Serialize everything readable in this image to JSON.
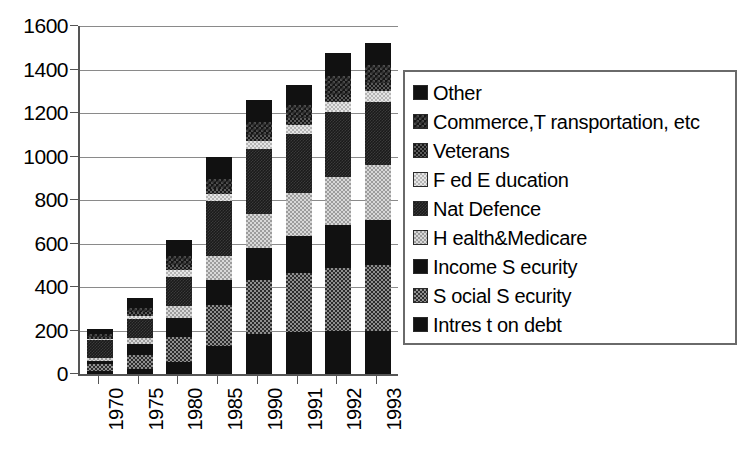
{
  "chart_data": {
    "type": "bar",
    "stacked": true,
    "title": "",
    "xlabel": "",
    "ylabel": "",
    "ylim": [
      0,
      1600
    ],
    "ytick_values": [
      0,
      200,
      400,
      600,
      800,
      1000,
      1200,
      1400,
      1600
    ],
    "ytick_labels": [
      "0",
      "200",
      "400",
      "600",
      "800",
      "1000",
      "1200",
      "1400",
      "1600"
    ],
    "grid": true,
    "legend_position": "right",
    "categories": [
      "1970",
      "1975",
      "1980",
      "1985",
      "1990",
      "1991",
      "1992",
      "1993"
    ],
    "totals": [
      205,
      348,
      615,
      1000,
      1258,
      1330,
      1474,
      1522
    ],
    "series": [
      {
        "name": "Intrest on debt",
        "pattern": "solid-black",
        "color": "#111111",
        "values": [
          14,
          23,
          53,
          130,
          184,
          195,
          199,
          199
        ]
      },
      {
        "name": "Social Security",
        "pattern": "med-gray",
        "color": "#2b2b2b",
        "values": [
          30,
          64,
          118,
          188,
          248,
          269,
          287,
          302
        ]
      },
      {
        "name": "Income Security",
        "pattern": "solid-black",
        "color": "#111111",
        "values": [
          16,
          50,
          87,
          113,
          147,
          172,
          199,
          208
        ]
      },
      {
        "name": "Health&Medicare",
        "pattern": "light-check",
        "color": "#d8d8d8",
        "values": [
          13,
          28,
          55,
          113,
          156,
          195,
          222,
          253
        ]
      },
      {
        "name": "Nat Defence",
        "pattern": "near-black",
        "color": "#1a1a1a",
        "values": [
          82,
          87,
          134,
          253,
          299,
          273,
          298,
          291
        ]
      },
      {
        "name": "Fed Education",
        "pattern": "vlight",
        "color": "#e6e6e6",
        "values": [
          8,
          16,
          32,
          29,
          38,
          43,
          46,
          50
        ]
      },
      {
        "name": "Veterans",
        "pattern": "dark-check",
        "color": "#171717",
        "values": [
          9,
          17,
          21,
          27,
          29,
          32,
          34,
          36
        ]
      },
      {
        "name": "Commerce,Transportation, etc",
        "pattern": "dark-dense",
        "color": "#141414",
        "values": [
          12,
          21,
          43,
          45,
          57,
          59,
          87,
          82
        ]
      },
      {
        "name": "Other",
        "pattern": "solid-black",
        "color": "#111111",
        "values": [
          21,
          42,
          72,
          102,
          100,
          92,
          102,
          101
        ]
      }
    ]
  },
  "legend": {
    "items": [
      {
        "label": "Other",
        "pattern": "solid-black"
      },
      {
        "label": "Commerce,T ransportation, etc",
        "pattern": "dark-dense"
      },
      {
        "label": "Veterans",
        "pattern": "dark-check"
      },
      {
        "label": "F ed E ducation",
        "pattern": "vlight"
      },
      {
        "label": "Nat Defence",
        "pattern": "near-black"
      },
      {
        "label": "H ealth&Medicare",
        "pattern": "light-check"
      },
      {
        "label": "Income S ecurity",
        "pattern": "solid-black"
      },
      {
        "label": "S ocial S ecurity",
        "pattern": "med-gray"
      },
      {
        "label": "Intres t on debt",
        "pattern": "solid-black"
      }
    ]
  }
}
